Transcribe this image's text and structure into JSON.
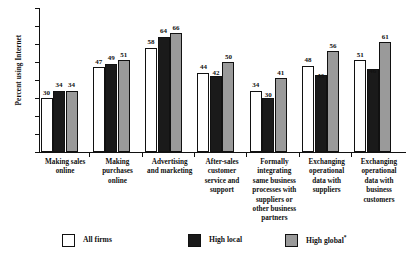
{
  "chart_data": {
    "type": "bar",
    "title": "",
    "xlabel": "",
    "ylabel": "Percent using Internet",
    "ylim": [
      0,
      80
    ],
    "yticks": [
      0,
      10,
      20,
      30,
      40,
      50,
      60,
      70,
      80
    ],
    "grid": false,
    "legend_position": "bottom",
    "categories": [
      "Making sales online",
      "Making purchases online",
      "Advertising and marketing",
      "After-sales customer service and support",
      "Formally integrating same business processes with suppliers or other business partners",
      "Exchanging operational data with suppliers",
      "Exchanging operational data with business customers"
    ],
    "category_lines": [
      [
        "Making sales",
        "online"
      ],
      [
        "Making",
        "purchases",
        "online"
      ],
      [
        "Advertising",
        "and marketing"
      ],
      [
        "After-sales",
        "customer",
        "service and",
        "support"
      ],
      [
        "Formally",
        "integrating",
        "same business",
        "processes with",
        "suppliers or",
        "other business",
        "partners"
      ],
      [
        "Exchanging",
        "operational",
        "data with",
        "suppliers"
      ],
      [
        "Exchanging",
        "operational",
        "data with",
        "business",
        "customers"
      ]
    ],
    "series": [
      {
        "name": "All firms",
        "color": "#ffffff",
        "values": [
          30,
          47,
          58,
          44,
          34,
          48,
          51
        ]
      },
      {
        "name": "High local",
        "color": "#1a1a1a",
        "values": [
          34,
          49,
          64,
          42,
          30,
          43,
          46
        ]
      },
      {
        "name": "High global",
        "color": "#9a9a9a",
        "values": [
          34,
          51,
          66,
          50,
          41,
          56,
          61
        ]
      }
    ]
  },
  "legend": {
    "items": [
      {
        "label": "All firms",
        "footnote": ""
      },
      {
        "label": "High local",
        "footnote": ""
      },
      {
        "label": "High global",
        "footnote": "*"
      }
    ]
  },
  "axis": {
    "y_title": "Percent using Internet",
    "y_tick_labels": [
      "80",
      "70",
      "60",
      "50",
      "40",
      "30",
      "20",
      "10",
      "0"
    ]
  }
}
